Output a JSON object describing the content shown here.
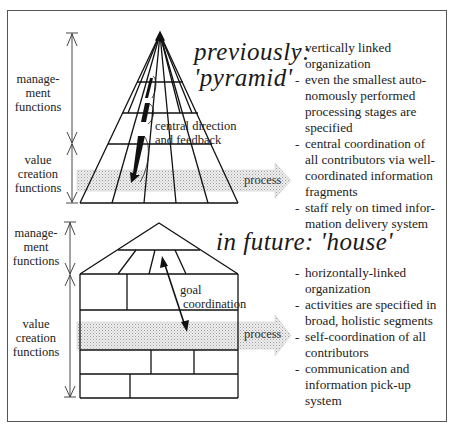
{
  "top": {
    "title_line1": "previously:",
    "title_line2": "'pyramid'",
    "left_labels": {
      "management": [
        "manage-",
        "ment",
        "functions"
      ],
      "value_creation": [
        "value",
        "creation",
        "functions"
      ]
    },
    "annotation": [
      "central direction",
      "and feedback"
    ],
    "process_label": "process",
    "bullets": [
      "vertically linked organization",
      "even the smallest autonomously performed processing stages are specified",
      "central coordination of all contributors via well-coordinated information fragments",
      "staff rely on timed information delivery system"
    ],
    "bullet_lines": [
      [
        "vertically linked",
        "organization"
      ],
      [
        "even the smallest auto-",
        "nomously performed",
        "processing stages are",
        "specified"
      ],
      [
        "central coordination of",
        "all contributors via well-",
        "coordinated information",
        "fragments"
      ],
      [
        "staff rely on timed infor-",
        "mation delivery system"
      ]
    ]
  },
  "bottom": {
    "title": "in future: 'house'",
    "left_labels": {
      "management": [
        "manage-",
        "ment",
        "functions"
      ],
      "value_creation": [
        "value",
        "creation",
        "functions"
      ]
    },
    "annotation": [
      "goal",
      "coordination"
    ],
    "process_label": "process",
    "bullet_lines": [
      [
        "horizontally-linked",
        "organization"
      ],
      [
        "activities are specified in",
        "broad, holistic segments"
      ],
      [
        "self-coordination of all",
        "contributors"
      ],
      [
        "communication and",
        "information pick-up",
        "system"
      ]
    ]
  }
}
